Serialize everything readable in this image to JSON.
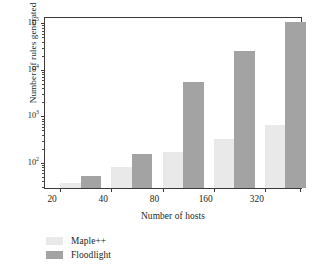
{
  "chart_data": {
    "type": "bar",
    "title": "",
    "xlabel": "Number of hosts",
    "ylabel": "Number of rules generated",
    "categories": [
      "20",
      "40",
      "80",
      "160",
      "320"
    ],
    "series": [
      {
        "name": "Maple++",
        "color": "#e9e9e9",
        "values": [
          38,
          80,
          170,
          320,
          670
        ]
      },
      {
        "name": "Floodlight",
        "color": "#a3a3a3",
        "values": [
          52,
          155,
          5500,
          25000,
          105000
        ]
      }
    ],
    "yscale": "log",
    "ylim": [
      29,
      130000
    ],
    "ytick_values": [
      100,
      1000,
      10000,
      100000
    ],
    "ytick_labels": [
      "10²",
      "10³",
      "10⁴",
      "10⁵"
    ],
    "ytick_mantissas": [
      "10",
      "10",
      "10",
      "10"
    ],
    "ytick_exponents": [
      "2",
      "3",
      "4",
      "5"
    ],
    "grid": false,
    "legend_position": "below-left",
    "legend_entries": [
      "Maple++",
      "Floodlight"
    ]
  }
}
